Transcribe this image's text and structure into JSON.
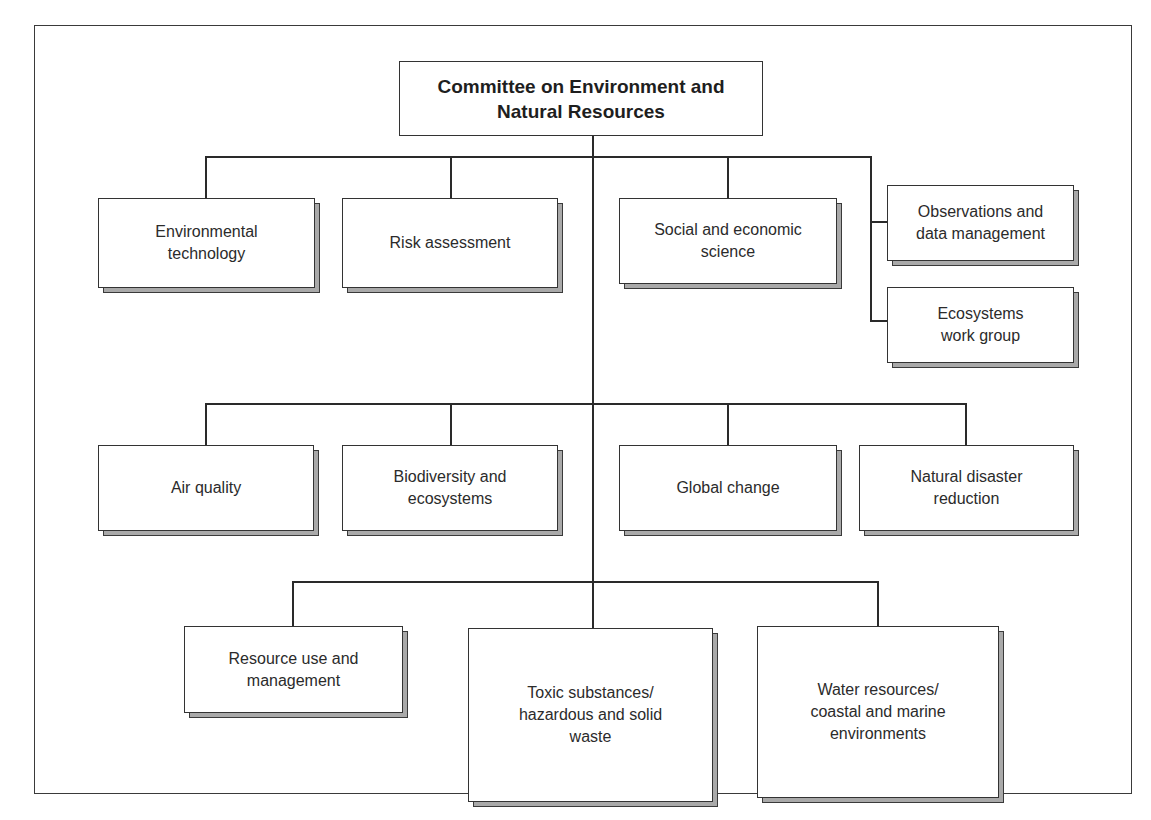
{
  "diagram": {
    "type": "org-chart",
    "root": {
      "label": "Committee on Environment and\nNatural Resources"
    },
    "groups": [
      {
        "name": "tier-1",
        "nodes": [
          {
            "id": "environmental-technology",
            "label": "Environmental\ntechnology"
          },
          {
            "id": "risk-assessment",
            "label": "Risk assessment"
          },
          {
            "id": "social-economic-science",
            "label": "Social and economic\nscience"
          },
          {
            "id": "observations-data-management",
            "label": "Observations and\ndata management"
          },
          {
            "id": "ecosystems-work-group",
            "label": "Ecosystems\nwork group"
          }
        ]
      },
      {
        "name": "tier-2",
        "nodes": [
          {
            "id": "air-quality",
            "label": "Air quality"
          },
          {
            "id": "biodiversity-ecosystems",
            "label": "Biodiversity and\necosystems"
          },
          {
            "id": "global-change",
            "label": "Global change"
          },
          {
            "id": "natural-disaster-reduction",
            "label": "Natural disaster\nreduction"
          }
        ]
      },
      {
        "name": "tier-3",
        "nodes": [
          {
            "id": "resource-use-management",
            "label": "Resource use and\nmanagement"
          },
          {
            "id": "toxic-substances-waste",
            "label": "Toxic substances/\nhazardous and solid\nwaste"
          },
          {
            "id": "water-resources-coastal-marine",
            "label": "Water resources/\ncoastal and marine\nenvironments"
          }
        ]
      }
    ],
    "edges": [
      [
        "root",
        "environmental-technology"
      ],
      [
        "root",
        "risk-assessment"
      ],
      [
        "root",
        "social-economic-science"
      ],
      [
        "root",
        "observations-data-management"
      ],
      [
        "root",
        "ecosystems-work-group"
      ],
      [
        "root",
        "air-quality"
      ],
      [
        "root",
        "biodiversity-ecosystems"
      ],
      [
        "root",
        "global-change"
      ],
      [
        "root",
        "natural-disaster-reduction"
      ],
      [
        "root",
        "resource-use-management"
      ],
      [
        "root",
        "toxic-substances-waste"
      ],
      [
        "root",
        "water-resources-coastal-marine"
      ]
    ],
    "colors": {
      "line": "#2a2a2a",
      "box_fill": "#ffffff",
      "shadow_fill": "#a9a9a9"
    }
  }
}
